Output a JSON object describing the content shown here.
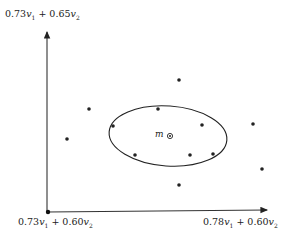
{
  "diagram": {
    "y_axis_label": {
      "coef1": "0.73",
      "var1": "v",
      "sub1": "1",
      "op": " + ",
      "coef2": "0.65",
      "var2": "v",
      "sub2": "2"
    },
    "origin_label": {
      "coef1": "0.73",
      "var1": "v",
      "sub1": "1",
      "op": " + ",
      "coef2": "0.60",
      "var2": "v",
      "sub2": "2"
    },
    "x_axis_label": {
      "coef1": "0.78",
      "var1": "v",
      "sub1": "1",
      "op": " + ",
      "coef2": "0.60",
      "var2": "v",
      "sub2": "2"
    },
    "mean_label": "m",
    "colors": {
      "ink": "#222222",
      "background": "#ffffff"
    },
    "points": [
      {
        "x": 179,
        "y": 80
      },
      {
        "x": 89,
        "y": 109
      },
      {
        "x": 158,
        "y": 109
      },
      {
        "x": 113,
        "y": 126
      },
      {
        "x": 202,
        "y": 125
      },
      {
        "x": 253,
        "y": 124
      },
      {
        "x": 67,
        "y": 139
      },
      {
        "x": 135,
        "y": 155
      },
      {
        "x": 190,
        "y": 155
      },
      {
        "x": 213,
        "y": 154
      },
      {
        "x": 262,
        "y": 169
      },
      {
        "x": 179,
        "y": 185
      }
    ],
    "mean_point": {
      "x": 170,
      "y": 136
    },
    "ellipse": {
      "cx": 168,
      "cy": 136,
      "rx": 59,
      "ry": 30,
      "rotation": 4
    }
  }
}
